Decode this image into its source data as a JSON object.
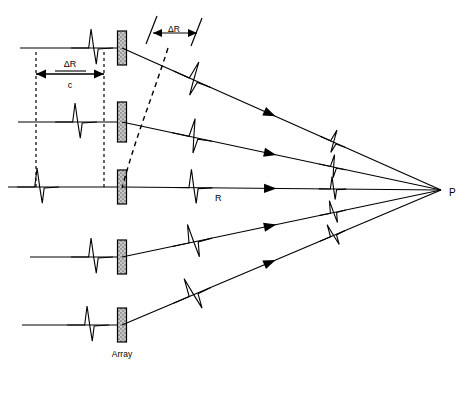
{
  "figure": {
    "title_visible": false,
    "point_label": "P",
    "range_label": "R",
    "delta_r_label": "ΔR",
    "delta_r_over_c": {
      "numerator": "ΔR",
      "denominator": "c"
    },
    "array_label": "Array",
    "caption": ""
  },
  "colors": {
    "line": "#000000",
    "background": "#ffffff",
    "element_fill": "#d9d9d9",
    "element_stroke": "#000000",
    "dashed": "#000000"
  },
  "geometry": {
    "focus": {
      "x": 441,
      "y": 190
    },
    "array_x": 122,
    "rows": [
      {
        "id": "row-1",
        "y": 48,
        "line_start_x": 20,
        "pulse_x": 92,
        "element_h": 34
      },
      {
        "id": "row-2",
        "y": 122,
        "line_start_x": 18,
        "pulse_x": 76,
        "element_h": 40
      },
      {
        "id": "row-3",
        "y": 187,
        "line_start_x": 8,
        "pulse_x": 38,
        "element_h": 34
      },
      {
        "id": "row-4",
        "y": 257,
        "line_start_x": 30,
        "pulse_x": 92,
        "element_h": 34
      },
      {
        "id": "row-5",
        "y": 325,
        "line_start_x": 22,
        "pulse_x": 88,
        "element_h": 34
      }
    ],
    "ray_arrow_t": [
      0.45,
      0.45,
      0.45,
      0.45,
      0.45
    ],
    "ray_pulse_t": [
      0.22,
      0.22,
      0.22,
      0.22,
      0.22
    ],
    "ray_pulse2_t": [
      0.66,
      0.66,
      0.66,
      0.66,
      0.66
    ]
  },
  "annotations": {
    "delta_r_bracket": {
      "tick_left_x": 152,
      "tick_right_x": 196,
      "y": 30,
      "label": "ΔR"
    },
    "delta_r_over_c_bracket": {
      "left_x": 36,
      "right_x": 104,
      "y": 74
    },
    "dashed_verticals": [
      {
        "x": 36,
        "y1": 52,
        "y2": 190
      },
      {
        "x": 104,
        "y1": 52,
        "y2": 190
      }
    ],
    "wavefront_arc": {
      "from": {
        "x": 168,
        "y": 48
      },
      "to": {
        "x": 122,
        "y": 188
      }
    }
  }
}
